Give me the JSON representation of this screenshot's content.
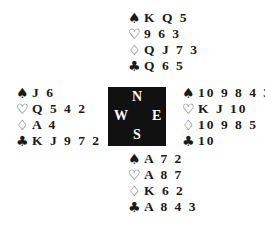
{
  "suit_symbols": {
    "spades": "♠",
    "hearts": "♡",
    "diamonds": "♢",
    "clubs": "♣"
  },
  "hands": {
    "north": {
      "spades": "K Q 5",
      "hearts": "9 6 3",
      "diamonds": "Q J 7 3",
      "clubs": "Q 6 5"
    },
    "west": {
      "spades": "J 6",
      "hearts": "Q 5 4 2",
      "diamonds": "A 4",
      "clubs": "K J 9 7 2"
    },
    "east": {
      "spades": "10 9 8 4 3",
      "hearts": "K J 10",
      "diamonds": "10 9 8 5",
      "clubs": "10"
    },
    "south": {
      "spades": "A 7 2",
      "hearts": "A 8 7",
      "diamonds": "K 6 2",
      "clubs": "A 8 4 3"
    }
  },
  "compass": {
    "north": "N",
    "south": "S",
    "west": "W",
    "east": "E"
  }
}
